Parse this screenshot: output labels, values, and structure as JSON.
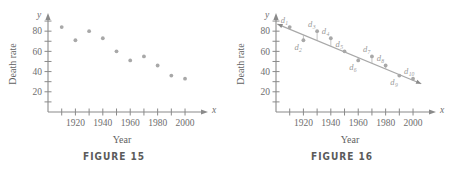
{
  "figures": [
    {
      "id": "figure-15",
      "caption": "FIGURE 15",
      "axis": {
        "x_var": "x",
        "y_var": "y",
        "xlabel": "Year",
        "ylabel": "Death rate"
      },
      "chart_data": {
        "type": "scatter",
        "title": "FIGURE 15",
        "xlabel": "Year",
        "ylabel": "Death rate",
        "x": [
          1910,
          1920,
          1930,
          1940,
          1950,
          1960,
          1970,
          1980,
          1990,
          2000
        ],
        "values": [
          84,
          71,
          80,
          73,
          60,
          51,
          55,
          46,
          36,
          33
        ],
        "xlim": [
          1900,
          2008
        ],
        "ylim": [
          0,
          95
        ],
        "xticks": [
          1910,
          1920,
          1930,
          1940,
          1950,
          1960,
          1970,
          1980,
          1990,
          2000
        ],
        "xtick_labels": [
          "",
          "1920",
          "",
          "1940",
          "",
          "1960",
          "",
          "1980",
          "",
          "2000"
        ],
        "yticks": [
          10,
          20,
          30,
          40,
          50,
          60,
          70,
          80,
          90
        ],
        "ytick_labels": [
          "",
          "20",
          "",
          "40",
          "",
          "60",
          "",
          "80",
          ""
        ],
        "grid": false,
        "legend": "none",
        "point_color": "#a8a8a8"
      }
    },
    {
      "id": "figure-16",
      "caption": "FIGURE 16",
      "axis": {
        "x_var": "x",
        "y_var": "y",
        "xlabel": "Year",
        "ylabel": "Death rate"
      },
      "chart_data": {
        "type": "scatter",
        "title": "FIGURE 16",
        "xlabel": "Year",
        "ylabel": "Death rate",
        "x": [
          1910,
          1920,
          1930,
          1940,
          1950,
          1960,
          1970,
          1980,
          1990,
          2000
        ],
        "values": [
          84,
          71,
          80,
          73,
          60,
          51,
          55,
          46,
          36,
          33
        ],
        "series": [
          {
            "name": "regression line",
            "type": "line",
            "endpoints": [
              [
                1901,
                87
              ],
              [
                2006,
                28
              ]
            ]
          }
        ],
        "annotations": [
          {
            "label": "d",
            "subscript": "1",
            "point_index": 0
          },
          {
            "label": "d",
            "subscript": "2",
            "point_index": 1
          },
          {
            "label": "d",
            "subscript": "3",
            "point_index": 2
          },
          {
            "label": "d",
            "subscript": "4",
            "point_index": 3
          },
          {
            "label": "d",
            "subscript": "5",
            "point_index": 4
          },
          {
            "label": "d",
            "subscript": "6",
            "point_index": 5
          },
          {
            "label": "d",
            "subscript": "7",
            "point_index": 6
          },
          {
            "label": "d",
            "subscript": "8",
            "point_index": 7
          },
          {
            "label": "d",
            "subscript": "9",
            "point_index": 8
          },
          {
            "label": "d",
            "subscript": "10",
            "point_index": 9
          }
        ],
        "xlim": [
          1900,
          2008
        ],
        "ylim": [
          0,
          95
        ],
        "xticks": [
          1910,
          1920,
          1930,
          1940,
          1950,
          1960,
          1970,
          1980,
          1990,
          2000
        ],
        "xtick_labels": [
          "",
          "1920",
          "",
          "1940",
          "",
          "1960",
          "",
          "1980",
          "",
          "2000"
        ],
        "yticks": [
          10,
          20,
          30,
          40,
          50,
          60,
          70,
          80,
          90
        ],
        "ytick_labels": [
          "",
          "20",
          "",
          "40",
          "",
          "60",
          "",
          "80",
          ""
        ],
        "grid": false,
        "legend": "none",
        "point_color": "#a8a8a8",
        "line_color": "#a8a8a8"
      }
    }
  ]
}
